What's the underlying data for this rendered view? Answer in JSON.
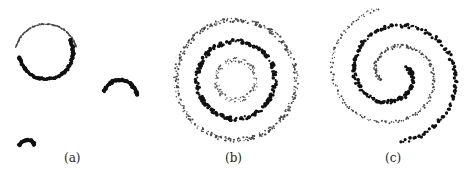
{
  "figure": {
    "panels": [
      {
        "id": "a",
        "caption": "(a)"
      },
      {
        "id": "b",
        "caption": "(b)"
      },
      {
        "id": "c",
        "caption": "(c)"
      }
    ]
  },
  "chart_data": [
    {
      "type": "scatter",
      "title": "(a)",
      "description": "Arcs of points: one large circle split into a light upper arc and a dark lower arc, plus two small dark arcs",
      "series": [
        {
          "name": "large-circle-upper",
          "shape": "arc",
          "cx": 46,
          "cy": 55,
          "r": 31,
          "start_deg": 165,
          "end_deg": 330,
          "dir": "ccw-top",
          "style": "light"
        },
        {
          "name": "large-circle-lower",
          "shape": "arc",
          "cx": 46,
          "cy": 52,
          "r": 27,
          "start_deg": 170,
          "end_deg": 10,
          "style": "dark"
        },
        {
          "name": "small-arc-right",
          "shape": "arc",
          "cx": 120,
          "cy": 97,
          "r": 17,
          "start_deg": 200,
          "end_deg": 355,
          "style": "dark"
        },
        {
          "name": "tiny-arc-bottom",
          "shape": "arc",
          "cx": 27,
          "cy": 148,
          "r": 8,
          "start_deg": 200,
          "end_deg": 340,
          "style": "dark"
        }
      ]
    },
    {
      "type": "scatter",
      "title": "(b)",
      "description": "Three concentric rings of points",
      "series": [
        {
          "name": "outer-ring",
          "shape": "ring",
          "cx": 236,
          "cy": 80,
          "r": 60,
          "style": "light"
        },
        {
          "name": "middle-ring",
          "shape": "ring",
          "cx": 236,
          "cy": 80,
          "r": 39,
          "style": "dark"
        },
        {
          "name": "inner-ring",
          "shape": "ring",
          "cx": 236,
          "cy": 80,
          "r": 20,
          "style": "lighter"
        }
      ]
    },
    {
      "type": "scatter",
      "title": "(c)",
      "description": "Two interleaved spirals of points (one dark, one light)",
      "series": [
        {
          "name": "dark-spiral",
          "shape": "spiral",
          "cx": 394,
          "cy": 74,
          "phase_deg": 180,
          "style": "dark"
        },
        {
          "name": "light-spiral",
          "shape": "spiral",
          "cx": 394,
          "cy": 74,
          "phase_deg": 0,
          "style": "light"
        }
      ]
    }
  ]
}
